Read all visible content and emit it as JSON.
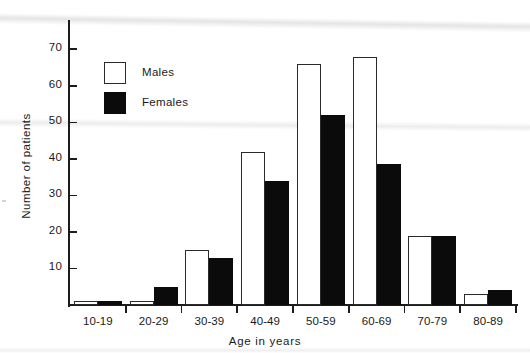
{
  "chart_data": {
    "type": "bar",
    "title": "",
    "subtitle": "",
    "xlabel": "Age in years",
    "ylabel": "Number of patients",
    "categories": [
      "10-19",
      "20-29",
      "30-39",
      "40-49",
      "50-59",
      "60-69",
      "70-79",
      "80-89"
    ],
    "series": [
      {
        "name": "Males",
        "swatch": "white-outlined-square",
        "color": "#ffffff",
        "edge_color": "#2a2a2a",
        "values": [
          1,
          1,
          15,
          42,
          66,
          68,
          19,
          3
        ]
      },
      {
        "name": "Females",
        "swatch": "black-filled-square",
        "color": "#0b0b0b",
        "edge_color": "#0b0b0b",
        "values": [
          1,
          5,
          13,
          34,
          52,
          38.5,
          19,
          4
        ]
      }
    ],
    "ylim": [
      0,
      78
    ],
    "yticks": [
      10,
      20,
      30,
      40,
      50,
      60,
      70
    ],
    "ytick_labels": [
      "10",
      "20",
      "30",
      "40",
      "50",
      "60",
      "70"
    ],
    "xlim_groups": 8,
    "grid": false,
    "legend_position": "upper-left-inside",
    "axis_color": "#1c1c1c",
    "background": "#ffffff"
  },
  "legend": {
    "items": [
      {
        "label": "Males"
      },
      {
        "label": "Females"
      }
    ]
  },
  "axes": {
    "y_title": "Number of patients",
    "x_title": "Age in years"
  }
}
